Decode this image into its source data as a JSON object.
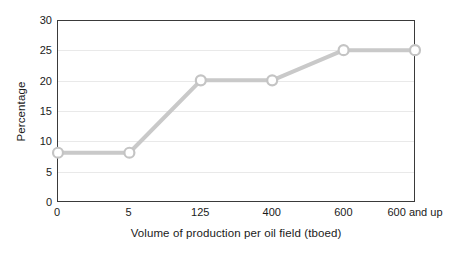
{
  "chart_data": {
    "type": "line",
    "title": "",
    "subtitle": "",
    "xlabel": "Volume of production per oil field (tboed)",
    "ylabel": "Percentage",
    "categories": [
      "0",
      "5",
      "125",
      "400",
      "600",
      "600 and up"
    ],
    "values": [
      8,
      8,
      20,
      20,
      25,
      25
    ],
    "series": [
      {
        "name": "Percentage",
        "values": [
          8,
          8,
          20,
          20,
          25,
          25
        ]
      }
    ],
    "ylim": [
      0,
      30
    ],
    "ytick_labels": [
      "30",
      "25",
      "20",
      "15",
      "10",
      "5",
      "0"
    ],
    "ytick_values": [
      30,
      25,
      20,
      15,
      10,
      5,
      0
    ],
    "grid": "horizontal",
    "legend": "none",
    "annotations": [],
    "colors": {
      "line": "#c9c9c9",
      "marker_fill": "#ffffff",
      "marker_stroke": "#c4c4c4",
      "axis": "#3a3a3a",
      "gridline": "#e9e9e9",
      "text": "#1a1a1a",
      "background": "#ffffff"
    }
  }
}
